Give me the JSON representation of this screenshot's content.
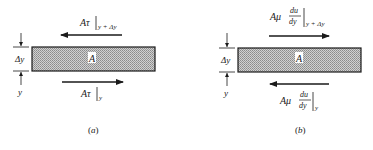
{
  "panels": [
    {
      "id": "a",
      "caption": "(a)",
      "area_label": "A",
      "top_force": {
        "main": "Aτ",
        "subscript": "y + Δy",
        "direction": "left"
      },
      "bottom_force": {
        "main": "Aτ",
        "subscript": "y",
        "direction": "right"
      },
      "dim_label_delta": "Δy",
      "dim_label_y": "y"
    },
    {
      "id": "b",
      "caption": "(b)",
      "area_label": "A",
      "top_force": {
        "main": "Aμ",
        "frac_num": "du",
        "frac_den": "dy",
        "subscript": "y + Δy",
        "direction": "right"
      },
      "bottom_force": {
        "main": "Aμ",
        "frac_num": "du",
        "frac_den": "dy",
        "subscript": "y",
        "direction": "left"
      },
      "dim_label_delta": "Δy",
      "dim_label_y": "y"
    }
  ],
  "colors": {
    "ink": "#1a1a1a",
    "fill": "#bdbdbd"
  }
}
